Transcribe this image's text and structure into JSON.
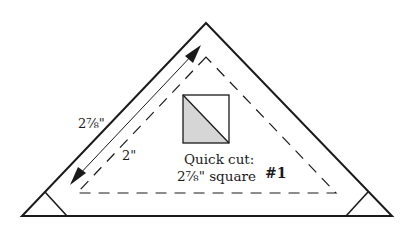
{
  "diagram": {
    "type": "quilt-block-piece",
    "labels": {
      "outer_edge": "2⅞\"",
      "finished_edge": "2\"",
      "quick_cut_line1": "Quick cut:",
      "quick_cut_line2": "2⅞\" square",
      "piece_number": "#1"
    },
    "colors": {
      "line": "#1a1a1a",
      "shade": "#d6d6d6",
      "background": "#ffffff"
    }
  }
}
